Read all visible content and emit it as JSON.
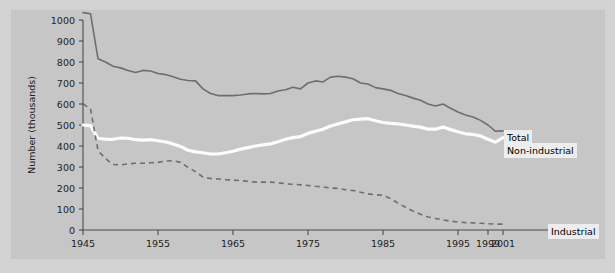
{
  "chart_data": {
    "type": "line",
    "title": "",
    "xlabel": "",
    "ylabel": "Number (thousands)",
    "xlim": [
      1945,
      2001
    ],
    "ylim": [
      0,
      1000
    ],
    "grid": false,
    "legend_position": "inline-right",
    "ytick_labels": [
      "0",
      "100",
      "200",
      "300",
      "400",
      "500",
      "600",
      "700",
      "800",
      "900",
      "1000"
    ],
    "ytick_values": [
      0,
      100,
      200,
      300,
      400,
      500,
      600,
      700,
      800,
      900,
      1000
    ],
    "xtick_labels": [
      "1945",
      "1955",
      "1965",
      "1975",
      "1985",
      "1995",
      "1999",
      "2001"
    ],
    "xtick_values": [
      1945,
      1955,
      1965,
      1975,
      1985,
      1995,
      1999,
      2001
    ],
    "series": [
      {
        "name": "Total",
        "style": "solid",
        "color": "#6e6e6e",
        "x": [
          1945,
          1946,
          1947,
          1948,
          1949,
          1950,
          1951,
          1952,
          1953,
          1954,
          1955,
          1956,
          1957,
          1958,
          1959,
          1960,
          1961,
          1962,
          1963,
          1964,
          1965,
          1966,
          1967,
          1968,
          1969,
          1970,
          1971,
          1972,
          1973,
          1974,
          1975,
          1976,
          1977,
          1978,
          1979,
          1980,
          1981,
          1982,
          1983,
          1984,
          1985,
          1986,
          1987,
          1988,
          1989,
          1990,
          1991,
          1992,
          1993,
          1994,
          1995,
          1996,
          1997,
          1998,
          1999,
          2000,
          2001
        ],
        "values": [
          1035,
          1030,
          815,
          800,
          780,
          772,
          760,
          750,
          760,
          757,
          745,
          740,
          730,
          718,
          712,
          710,
          672,
          650,
          640,
          640,
          640,
          643,
          648,
          650,
          648,
          650,
          662,
          668,
          680,
          672,
          700,
          710,
          705,
          728,
          732,
          728,
          720,
          700,
          695,
          678,
          672,
          665,
          650,
          640,
          628,
          618,
          600,
          590,
          600,
          580,
          562,
          548,
          538,
          522,
          500,
          470,
          472
        ]
      },
      {
        "name": "Non-industrial",
        "style": "solid-white",
        "color": "#fdfdfd",
        "x": [
          1945,
          1946,
          1947,
          1948,
          1949,
          1950,
          1951,
          1952,
          1953,
          1954,
          1955,
          1956,
          1957,
          1958,
          1959,
          1960,
          1961,
          1962,
          1963,
          1964,
          1965,
          1966,
          1967,
          1968,
          1969,
          1970,
          1971,
          1972,
          1973,
          1974,
          1975,
          1976,
          1977,
          1978,
          1979,
          1980,
          1981,
          1982,
          1983,
          1984,
          1985,
          1986,
          1987,
          1988,
          1989,
          1990,
          1991,
          1992,
          1993,
          1994,
          1995,
          1996,
          1997,
          1998,
          1999,
          2000,
          2001
        ],
        "values": [
          500,
          497,
          437,
          433,
          432,
          438,
          437,
          430,
          428,
          430,
          425,
          420,
          410,
          398,
          380,
          372,
          368,
          362,
          362,
          368,
          375,
          385,
          392,
          400,
          405,
          410,
          420,
          432,
          440,
          445,
          460,
          470,
          480,
          495,
          505,
          515,
          525,
          528,
          530,
          520,
          512,
          508,
          505,
          500,
          495,
          490,
          480,
          480,
          490,
          478,
          468,
          458,
          455,
          448,
          432,
          418,
          440
        ]
      },
      {
        "name": "Industrial",
        "style": "dashed",
        "color": "#6e6e6e",
        "x": [
          1945,
          1946,
          1947,
          1948,
          1949,
          1950,
          1951,
          1952,
          1953,
          1954,
          1955,
          1956,
          1957,
          1958,
          1959,
          1960,
          1961,
          1962,
          1963,
          1964,
          1965,
          1966,
          1967,
          1968,
          1969,
          1970,
          1971,
          1972,
          1973,
          1974,
          1975,
          1976,
          1977,
          1978,
          1979,
          1980,
          1981,
          1982,
          1983,
          1984,
          1985,
          1986,
          1987,
          1988,
          1989,
          1990,
          1991,
          1992,
          1993,
          1994,
          1995,
          1996,
          1997,
          1998,
          1999,
          2000,
          2001
        ],
        "values": [
          600,
          578,
          378,
          340,
          312,
          310,
          315,
          318,
          318,
          320,
          322,
          328,
          330,
          322,
          298,
          278,
          252,
          245,
          243,
          240,
          238,
          235,
          232,
          228,
          228,
          228,
          225,
          220,
          218,
          215,
          212,
          208,
          205,
          200,
          198,
          192,
          188,
          180,
          172,
          168,
          165,
          150,
          128,
          108,
          90,
          75,
          62,
          55,
          48,
          42,
          38,
          35,
          34,
          32,
          30,
          28,
          28
        ]
      }
    ]
  },
  "labels": {
    "total": "Total",
    "nonindustrial": "Non-industrial",
    "industrial": "Industrial"
  }
}
